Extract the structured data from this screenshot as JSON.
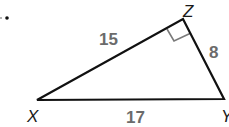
{
  "diagram": {
    "bullet": "•",
    "vertices": {
      "X": {
        "label": "X",
        "x": 37,
        "y": 100
      },
      "Y": {
        "label": "Y",
        "x": 224,
        "y": 99
      },
      "Z": {
        "label": "Z",
        "x": 183,
        "y": 19
      }
    },
    "sides": {
      "XZ": "15",
      "ZY": "8",
      "XY": "17"
    },
    "right_angle_at": "Z",
    "colors": {
      "line": "#111111",
      "marker": "#7a7a7a",
      "side_label": "#6b6b6b"
    }
  }
}
